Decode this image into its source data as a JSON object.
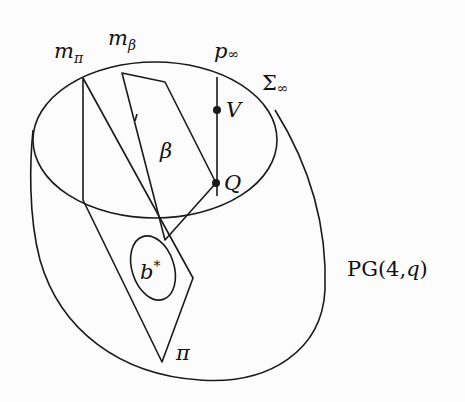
{
  "figure": {
    "title": "",
    "labels": {
      "m_pi": "m",
      "m_pi_sub": "π",
      "m_beta": "m",
      "m_beta_sub": "β",
      "p_inf": "p",
      "p_inf_sub": "∞",
      "sigma_inf": "Σ",
      "sigma_inf_sub": "∞",
      "V": "V",
      "Q": "Q",
      "beta": "β",
      "b_star": "b",
      "b_star_sup": "*",
      "pi": "π",
      "space": "PG(4,",
      "space_q": "q",
      "space_close": ")"
    },
    "colors": {
      "line": "#1a1a1a",
      "background": "#fcfcfc"
    }
  }
}
